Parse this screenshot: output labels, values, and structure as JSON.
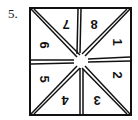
{
  "problem": {
    "label": "5."
  },
  "figure": {
    "sections": [
      {
        "id": "top-left-upper",
        "number": "7",
        "rotation": 180
      },
      {
        "id": "top-right-upper",
        "number": "8",
        "rotation": 180
      },
      {
        "id": "right-upper",
        "number": "1",
        "rotation": 90
      },
      {
        "id": "right-lower",
        "number": "2",
        "rotation": 90
      },
      {
        "id": "bottom-right",
        "number": "3",
        "rotation": 180
      },
      {
        "id": "bottom-left",
        "number": "4",
        "rotation": 180
      },
      {
        "id": "left-lower",
        "number": "5",
        "rotation": 90
      },
      {
        "id": "left-upper",
        "number": "6",
        "rotation": 90
      }
    ],
    "line_color": "#111111",
    "background": "#ffffff"
  }
}
